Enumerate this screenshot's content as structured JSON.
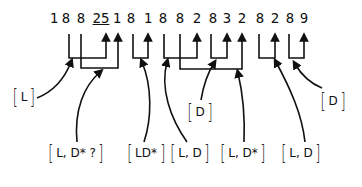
{
  "diagram": {
    "digits": [
      {
        "text": "1",
        "x": 54
      },
      {
        "text": "8",
        "x": 66
      },
      {
        "text": "8",
        "x": 81
      },
      {
        "text": "25",
        "x": 101,
        "underlined": true
      },
      {
        "text": "1",
        "x": 117
      },
      {
        "text": "8",
        "x": 131
      },
      {
        "text": "1",
        "x": 148
      },
      {
        "text": "8",
        "x": 163
      },
      {
        "text": "8",
        "x": 180
      },
      {
        "text": "2",
        "x": 197
      },
      {
        "text": "8",
        "x": 213
      },
      {
        "text": "3",
        "x": 227
      },
      {
        "text": "2",
        "x": 242
      },
      {
        "text": "8",
        "x": 260
      },
      {
        "text": "2",
        "x": 275
      },
      {
        "text": "8",
        "x": 290
      },
      {
        "text": "9",
        "x": 304
      }
    ],
    "labels": [
      {
        "id": "label-L",
        "text": "L",
        "x": 24,
        "y": 97
      },
      {
        "id": "label-L-Dstar-q",
        "text": "L, D* ?",
        "x": 76,
        "y": 153
      },
      {
        "id": "label-LDstar",
        "text": "LD*",
        "x": 146,
        "y": 153
      },
      {
        "id": "label-L-D-1",
        "text": "L, D",
        "x": 190,
        "y": 153
      },
      {
        "id": "label-D-1",
        "text": "D",
        "x": 200,
        "y": 112
      },
      {
        "id": "label-L-Dstar",
        "text": "L, D*",
        "x": 243,
        "y": 153
      },
      {
        "id": "label-L-D-2",
        "text": "L, D",
        "x": 301,
        "y": 153
      },
      {
        "id": "label-D-2",
        "text": "D",
        "x": 333,
        "y": 101
      }
    ]
  }
}
